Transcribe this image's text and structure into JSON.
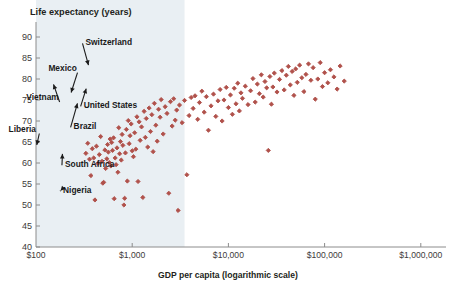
{
  "chart_data": {
    "type": "scatter",
    "title": "",
    "ylabel": "Life expectancy (years)",
    "xlabel": "GDP per capita (logarithmic scale)",
    "xscale": "log",
    "xlim": [
      100,
      1000000
    ],
    "ylim": [
      40,
      92
    ],
    "grid": false,
    "legend": null,
    "point_color": "#b0514b",
    "xticks": [
      {
        "value": 100,
        "label": "$100"
      },
      {
        "value": 1000,
        "label": "$1,000"
      },
      {
        "value": 10000,
        "label": "$10,000"
      },
      {
        "value": 100000,
        "label": "$100,000"
      },
      {
        "value": 1000000,
        "label": "$1,000,000"
      }
    ],
    "yticks": [
      {
        "value": 40,
        "label": "40"
      },
      {
        "value": 45,
        "label": "45"
      },
      {
        "value": 50,
        "label": "50"
      },
      {
        "value": 55,
        "label": "55"
      },
      {
        "value": 60,
        "label": "60"
      },
      {
        "value": 65,
        "label": "65"
      },
      {
        "value": 70,
        "label": "70"
      },
      {
        "value": 75,
        "label": "75"
      },
      {
        "value": 80,
        "label": "80"
      },
      {
        "value": 85,
        "label": "85"
      },
      {
        "value": 90,
        "label": "90"
      }
    ],
    "annotations": [
      {
        "label": "Vietnam",
        "text_x": 117,
        "text_y": 75,
        "tip_x": 148,
        "tip_y": 79.5,
        "anchor": "middle"
      },
      {
        "label": "Mexico",
        "text_x": 189,
        "text_y": 82,
        "tip_x": 226,
        "tip_y": 76,
        "anchor": "middle"
      },
      {
        "label": "Switzerland",
        "text_x": 327,
        "text_y": 88,
        "tip_x": 359,
        "tip_y": 82.5,
        "anchor": "start"
      },
      {
        "label": "United States",
        "text_x": 313,
        "text_y": 73,
        "tip_x": 341,
        "tip_y": 78.5,
        "anchor": "start"
      },
      {
        "label": "Brazil",
        "text_x": 246,
        "text_y": 68,
        "tip_x": 276,
        "tip_y": 75,
        "anchor": "start"
      },
      {
        "label": "Liberia",
        "text_x": 72,
        "text_y": 67.5,
        "tip_x": 100,
        "tip_y": 63.5,
        "anchor": "middle"
      },
      {
        "label": "South Africa",
        "text_x": 200,
        "text_y": 59,
        "tip_x": 189,
        "tip_y": 63,
        "anchor": "start"
      },
      {
        "label": "Nigeria",
        "text_x": 191,
        "text_y": 52.8,
        "tip_x": 170,
        "tip_y": 52.8,
        "anchor": "start"
      }
    ],
    "shaded_band": {
      "x_from": 100,
      "x_to": 3500,
      "note": "light blue background band on left portion of plot"
    },
    "points": [
      [
        330,
        62.3
      ],
      [
        345,
        64.7
      ],
      [
        360,
        60.9
      ],
      [
        372,
        57.0
      ],
      [
        385,
        63.4
      ],
      [
        398,
        61.2
      ],
      [
        410,
        51.2
      ],
      [
        425,
        64.0
      ],
      [
        440,
        59.9
      ],
      [
        455,
        62.0
      ],
      [
        470,
        66.3
      ],
      [
        485,
        60.4
      ],
      [
        495,
        55.2
      ],
      [
        505,
        55.4
      ],
      [
        520,
        63.1
      ],
      [
        530,
        58.7
      ],
      [
        545,
        61.0
      ],
      [
        555,
        64.4
      ],
      [
        565,
        62.6
      ],
      [
        578,
        60.1
      ],
      [
        590,
        65.7
      ],
      [
        600,
        59.3
      ],
      [
        612,
        64.9
      ],
      [
        625,
        63.0
      ],
      [
        640,
        66.0
      ],
      [
        650,
        51.5
      ],
      [
        665,
        61.2
      ],
      [
        680,
        59.6
      ],
      [
        695,
        63.6
      ],
      [
        710,
        57.8
      ],
      [
        725,
        68.4
      ],
      [
        740,
        62.2
      ],
      [
        755,
        65.1
      ],
      [
        770,
        60.7
      ],
      [
        785,
        66.8
      ],
      [
        800,
        64.2
      ],
      [
        820,
        50.0
      ],
      [
        835,
        51.6
      ],
      [
        850,
        62.4
      ],
      [
        870,
        68.0
      ],
      [
        890,
        55.7
      ],
      [
        910,
        70.1
      ],
      [
        930,
        64.6
      ],
      [
        950,
        66.5
      ],
      [
        975,
        69.3
      ],
      [
        1000,
        62.9
      ],
      [
        1030,
        61.5
      ],
      [
        1060,
        67.2
      ],
      [
        1090,
        63.3
      ],
      [
        1120,
        71.0
      ],
      [
        1150,
        55.6
      ],
      [
        1180,
        69.8
      ],
      [
        1210,
        65.4
      ],
      [
        1250,
        68.6
      ],
      [
        1290,
        51.8
      ],
      [
        1330,
        72.3
      ],
      [
        1370,
        66.1
      ],
      [
        1400,
        70.6
      ],
      [
        1450,
        63.8
      ],
      [
        1500,
        73.1
      ],
      [
        1550,
        67.5
      ],
      [
        1600,
        71.5
      ],
      [
        1650,
        62.7
      ],
      [
        1700,
        74.2
      ],
      [
        1760,
        69.0
      ],
      [
        1820,
        65.2
      ],
      [
        1880,
        72.8
      ],
      [
        1950,
        70.9
      ],
      [
        2000,
        75.1
      ],
      [
        2100,
        66.9
      ],
      [
        2200,
        73.4
      ],
      [
        2300,
        71.8
      ],
      [
        2400,
        52.8
      ],
      [
        2500,
        74.6
      ],
      [
        2600,
        68.8
      ],
      [
        2700,
        75.3
      ],
      [
        2800,
        70.2
      ],
      [
        2900,
        72.6
      ],
      [
        3000,
        48.7
      ],
      [
        3100,
        73.8
      ],
      [
        3300,
        69.6
      ],
      [
        3500,
        74.9
      ],
      [
        3700,
        57.2
      ],
      [
        3900,
        71.3
      ],
      [
        4100,
        75.6
      ],
      [
        4300,
        73.0
      ],
      [
        4500,
        76.0
      ],
      [
        4800,
        70.4
      ],
      [
        5000,
        74.4
      ],
      [
        5300,
        77.1
      ],
      [
        5600,
        72.1
      ],
      [
        5900,
        75.8
      ],
      [
        6200,
        67.8
      ],
      [
        6600,
        73.6
      ],
      [
        7000,
        76.4
      ],
      [
        7400,
        71.1
      ],
      [
        7800,
        74.8
      ],
      [
        8200,
        77.5
      ],
      [
        8600,
        70.0
      ],
      [
        9000,
        75.0
      ],
      [
        9500,
        78.0
      ],
      [
        10000,
        73.2
      ],
      [
        10500,
        76.2
      ],
      [
        11000,
        71.6
      ],
      [
        11500,
        77.8
      ],
      [
        12000,
        74.1
      ],
      [
        12500,
        79.0
      ],
      [
        13000,
        72.4
      ],
      [
        13500,
        76.7
      ],
      [
        14000,
        75.4
      ],
      [
        15000,
        78.3
      ],
      [
        16000,
        73.9
      ],
      [
        17000,
        77.2
      ],
      [
        18000,
        80.1
      ],
      [
        19000,
        74.5
      ],
      [
        20000,
        78.8
      ],
      [
        21000,
        76.5
      ],
      [
        22000,
        81.0
      ],
      [
        23000,
        75.7
      ],
      [
        24000,
        79.4
      ],
      [
        25000,
        77.9
      ],
      [
        26000,
        63.0
      ],
      [
        27000,
        80.6
      ],
      [
        28000,
        74.0
      ],
      [
        29000,
        78.1
      ],
      [
        30000,
        81.4
      ],
      [
        32000,
        76.9
      ],
      [
        34000,
        79.9
      ],
      [
        36000,
        82.0
      ],
      [
        38000,
        77.4
      ],
      [
        40000,
        80.9
      ],
      [
        42000,
        83.0
      ],
      [
        44000,
        78.6
      ],
      [
        46000,
        81.8
      ],
      [
        48000,
        76.1
      ],
      [
        50000,
        82.4
      ],
      [
        52000,
        79.2
      ],
      [
        55000,
        83.3
      ],
      [
        58000,
        80.3
      ],
      [
        61000,
        77.0
      ],
      [
        64000,
        81.1
      ],
      [
        68000,
        83.6
      ],
      [
        72000,
        79.7
      ],
      [
        76000,
        82.7
      ],
      [
        80000,
        75.2
      ],
      [
        85000,
        80.0
      ],
      [
        90000,
        83.9
      ],
      [
        95000,
        78.2
      ],
      [
        100000,
        81.5
      ],
      [
        108000,
        79.1
      ],
      [
        115000,
        82.2
      ],
      [
        125000,
        80.5
      ],
      [
        135000,
        77.6
      ],
      [
        145000,
        83.1
      ],
      [
        160000,
        79.5
      ]
    ]
  }
}
